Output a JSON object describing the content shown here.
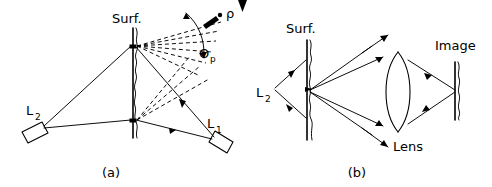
{
  "figure": {
    "background_color": "#ffffff",
    "ink_color": "#000000",
    "width": 492,
    "height": 187
  },
  "panels": [
    {
      "id": "a",
      "caption": "(a)",
      "description": "Goniometric scatterometer: two laser sources illuminate a rough surface, scattered light fan measured at angle theta_p by detector rho",
      "labels": {
        "surface": "Surf.",
        "source_1": "L",
        "source_1_sub": "1",
        "source_2": "L",
        "source_2_sub": "2",
        "detector": "ρ",
        "angle": "Θ",
        "angle_sub": "p"
      }
    },
    {
      "id": "b",
      "caption": "(b)",
      "description": "Imaging arrangement: source L2 illuminates rough surface, scattered rays collected by a lens and focused onto the image plane",
      "labels": {
        "surface": "Surf.",
        "source_2": "L",
        "source_2_sub": "2",
        "lens": "Lens",
        "image": "Image"
      }
    }
  ]
}
